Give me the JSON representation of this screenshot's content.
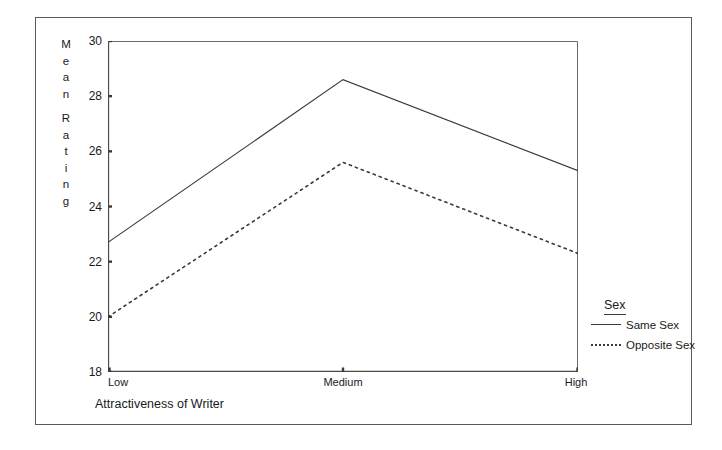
{
  "chart_data": {
    "type": "line",
    "title": "",
    "xlabel": "Attractiveness of Writer",
    "ylabel": "Mean Rating",
    "categories": [
      "Low",
      "Medium",
      "High"
    ],
    "ylim": [
      18,
      30
    ],
    "yticks": [
      18,
      20,
      22,
      24,
      26,
      28,
      30
    ],
    "ytick_labels": [
      "18",
      "20",
      "22",
      "24",
      "26",
      "28",
      "30"
    ],
    "grid": false,
    "legend_position": "right-bottom-outside",
    "legend_title": "Sex",
    "series": [
      {
        "name": "Same Sex",
        "style": "solid",
        "color": "#3a3a3a",
        "values": [
          22.7,
          28.6,
          25.3
        ]
      },
      {
        "name": "Opposite Sex",
        "style": "dotted",
        "color": "#3a3a3a",
        "values": [
          20.0,
          25.6,
          22.3
        ]
      }
    ]
  },
  "axes": {
    "y_title_letters": [
      "M",
      "e",
      "a",
      "n",
      "",
      "R",
      "a",
      "t",
      "i",
      "n",
      "g"
    ],
    "x_title": "Attractiveness of Writer"
  },
  "legend": {
    "title": "Sex",
    "entries": [
      {
        "label": "Same Sex",
        "style": "solid"
      },
      {
        "label": "Opposite Sex",
        "style": "dotted"
      }
    ]
  },
  "ticks": {
    "y": [
      "30",
      "28",
      "26",
      "24",
      "22",
      "20",
      "18"
    ],
    "x": [
      "Low",
      "Medium",
      "High"
    ]
  }
}
